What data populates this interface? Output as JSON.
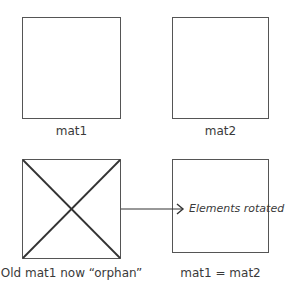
{
  "diagram": {
    "top_left": {
      "label": "mat1"
    },
    "top_right": {
      "label": "mat2"
    },
    "bottom_left": {
      "label": "Old mat1 now “orphan”",
      "crossed_out": true
    },
    "bottom_right": {
      "label": "mat1 = mat2",
      "annotation": "Elements rotated"
    },
    "arrow": {
      "from": "bottom_left",
      "to": "bottom_right"
    }
  },
  "colors": {
    "stroke": "#555555",
    "text": "#3a3a3a",
    "background": "#ffffff"
  }
}
